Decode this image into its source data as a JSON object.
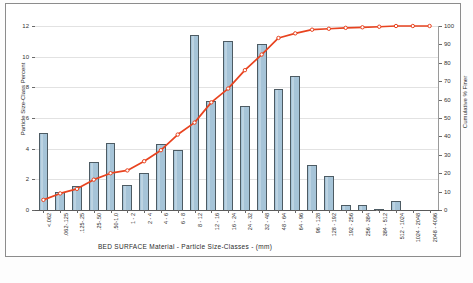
{
  "chart_data": {
    "type": "bar",
    "title": "",
    "xlabel": "BED SURFACE  Material  -   Particle Size-Classes  -  (mm)",
    "ylabel": "Particle Size-Class Percent",
    "y2label": "Cumulative % Finer",
    "ylim": [
      0,
      12
    ],
    "y2lim": [
      0,
      100
    ],
    "grid": true,
    "legend": "none",
    "categories": [
      "<.062",
      ".062-.125",
      ".125-.25",
      ".25-.50",
      ".50-1.0",
      "1 - 2",
      "2 - 4",
      "4 - 6",
      "6 - 8",
      "8 - 12",
      "12 - 16",
      "16 - 24",
      "24 - 32",
      "32 - 48",
      "48 - 64",
      "64 - 96",
      "96 - 128",
      "128 - 192",
      "192 - 256",
      "256 - 384",
      "384 - 512",
      "512 - 1024",
      "1024 - 2048",
      "2048 - 4096"
    ],
    "series": [
      {
        "name": "Particle Size-Class Percent",
        "type": "bar",
        "axis": "left",
        "color": "#a6c4d8",
        "edge_color": "#4d5b63",
        "values": [
          5.0,
          1.15,
          1.55,
          3.1,
          4.35,
          1.65,
          2.4,
          4.3,
          3.9,
          11.4,
          7.1,
          11.05,
          6.8,
          10.85,
          7.9,
          8.75,
          2.95,
          2.25,
          0.35,
          0.35,
          0.07,
          0.6,
          0.0,
          0.0
        ]
      },
      {
        "name": "Cumulative % Finer",
        "type": "line",
        "axis": "right",
        "color": "#e8431f",
        "marker": "circle-open",
        "values": [
          5.5,
          9.0,
          11.5,
          16.5,
          20.0,
          21.5,
          26.5,
          32.5,
          41.0,
          47.5,
          58.5,
          66.0,
          76.0,
          84.5,
          93.5,
          96.0,
          98.0,
          98.5,
          99.0,
          99.3,
          99.6,
          100.0,
          100.0,
          100.0
        ]
      }
    ],
    "yticks_left": [
      0,
      2,
      4,
      6,
      8,
      10,
      12
    ],
    "yticks_right": [
      0,
      10,
      20,
      30,
      40,
      50,
      60,
      70,
      80,
      90,
      100
    ]
  }
}
